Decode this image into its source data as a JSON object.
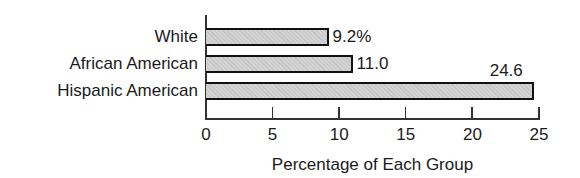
{
  "chart_data": {
    "type": "bar",
    "orientation": "horizontal",
    "title": "",
    "categories": [
      "White",
      "African American",
      "Hispanic American"
    ],
    "values": [
      9.2,
      11.0,
      24.6
    ],
    "value_labels": [
      "9.2%",
      "11.0",
      "24.6"
    ],
    "xlabel": "Percentage of Each Group",
    "ylabel": "",
    "xlim": [
      0,
      25
    ],
    "x_ticks": [
      "0",
      "5",
      "10",
      "15",
      "20",
      "25"
    ],
    "grid": false,
    "legend": null,
    "bar_color": "#d2d2d2",
    "bar_edge_color": "#111111"
  }
}
